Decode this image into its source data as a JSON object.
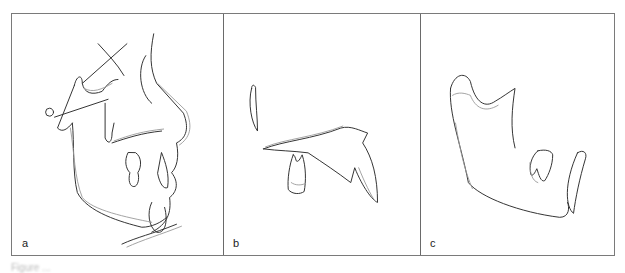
{
  "figure": {
    "panels": [
      {
        "label": "a",
        "content": "superimposed lateral cephalometric tracing, full craniofacial profile"
      },
      {
        "label": "b",
        "content": "superimposed maxilla tracing with molar and incisor"
      },
      {
        "label": "c",
        "content": "superimposed mandible tracing with molar and incisor"
      }
    ],
    "caption": "Figure ..."
  },
  "colors": {
    "frame": "#7a7a7a",
    "line_dark": "#333333",
    "line_light": "#999999"
  }
}
